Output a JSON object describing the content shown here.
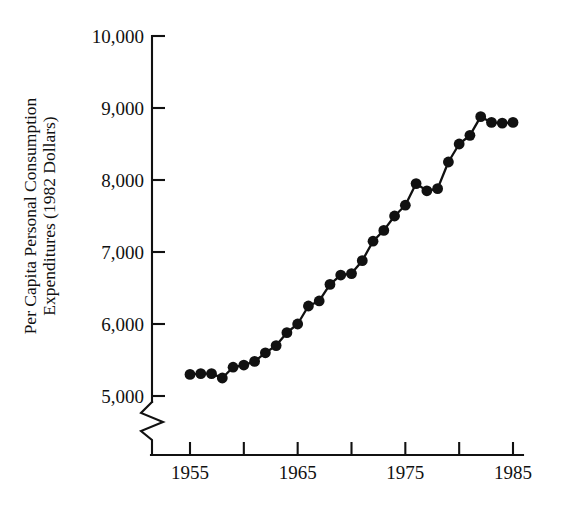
{
  "chart_data": {
    "type": "line",
    "title": "",
    "subtitle": "",
    "xlabel": "",
    "ylabel": "Per Capita Personal Consumption Expenditures (1982 Dollars)",
    "ylabel_line1": "Per Capita Personal Consumption",
    "ylabel_line2": "Expenditures (1982 Dollars)",
    "x": [
      1955,
      1956,
      1957,
      1958,
      1959,
      1960,
      1961,
      1962,
      1963,
      1964,
      1965,
      1966,
      1967,
      1968,
      1969,
      1970,
      1971,
      1972,
      1973,
      1974,
      1975,
      1976,
      1977,
      1978,
      1979,
      1980,
      1981,
      1982,
      1983,
      1984,
      1985
    ],
    "values": [
      5300,
      5310,
      5310,
      5250,
      5400,
      5430,
      5480,
      5600,
      5700,
      5880,
      6000,
      6250,
      6320,
      6550,
      6680,
      6700,
      6880,
      7150,
      7300,
      7500,
      7650,
      7950,
      7850,
      7880,
      8250,
      8500,
      8620,
      8880,
      8800,
      8790,
      8800
    ],
    "series": [
      {
        "name": "Per capita personal consumption expenditures",
        "values": [
          5300,
          5310,
          5310,
          5250,
          5400,
          5430,
          5480,
          5600,
          5700,
          5880,
          6000,
          6250,
          6320,
          6550,
          6680,
          6700,
          6880,
          7150,
          7300,
          7500,
          7650,
          7950,
          7850,
          7880,
          8250,
          8500,
          8620,
          8880,
          8800,
          8790,
          8800
        ]
      }
    ],
    "points": [
      {
        "year": 1955,
        "value": 5300
      },
      {
        "year": 1956,
        "value": 5310
      },
      {
        "year": 1957,
        "value": 5310
      },
      {
        "year": 1958,
        "value": 5250
      },
      {
        "year": 1959,
        "value": 5400
      },
      {
        "year": 1960,
        "value": 5430
      },
      {
        "year": 1961,
        "value": 5480
      },
      {
        "year": 1962,
        "value": 5600
      },
      {
        "year": 1963,
        "value": 5700
      },
      {
        "year": 1964,
        "value": 5880
      },
      {
        "year": 1965,
        "value": 6000
      },
      {
        "year": 1966,
        "value": 6250
      },
      {
        "year": 1967,
        "value": 6320
      },
      {
        "year": 1968,
        "value": 6550
      },
      {
        "year": 1969,
        "value": 6680
      },
      {
        "year": 1970,
        "value": 6700
      },
      {
        "year": 1971,
        "value": 6880
      },
      {
        "year": 1972,
        "value": 7150
      },
      {
        "year": 1973,
        "value": 7300
      },
      {
        "year": 1974,
        "value": 7500
      },
      {
        "year": 1975,
        "value": 7650
      },
      {
        "year": 1976,
        "value": 7950
      },
      {
        "year": 1977,
        "value": 7850
      },
      {
        "year": 1978,
        "value": 7880
      },
      {
        "year": 1979,
        "value": 8250
      },
      {
        "year": 1980,
        "value": 8500
      },
      {
        "year": 1981,
        "value": 8620
      },
      {
        "year": 1982,
        "value": 8880
      },
      {
        "year": 1983,
        "value": 8800
      },
      {
        "year": 1984,
        "value": 8790
      },
      {
        "year": 1985,
        "value": 8800
      }
    ],
    "ylim": [
      5000,
      10000
    ],
    "xlim": [
      1955,
      1985
    ],
    "ytick_values": [
      5000,
      6000,
      7000,
      8000,
      9000,
      10000
    ],
    "ytick_labels": [
      "5,000",
      "6,000",
      "7,000",
      "8,000",
      "9,000",
      "10,000"
    ],
    "xtick_values": [
      1955,
      1960,
      1965,
      1970,
      1975,
      1980,
      1985
    ],
    "xtick_labels": [
      "1955",
      "",
      "1965",
      "",
      "1975",
      "",
      "1985"
    ],
    "xtick_labels_all": [
      "1955",
      "1960",
      "1965",
      "1970",
      "1975",
      "1980",
      "1985"
    ],
    "grid": false,
    "legend": false,
    "legend_position": "none",
    "axis_break": {
      "axis": "y",
      "present": true,
      "description": "zigzag break on y-axis below 5,000"
    },
    "marker": "filled-circle",
    "line_color": "#111111",
    "marker_color": "#111111"
  }
}
